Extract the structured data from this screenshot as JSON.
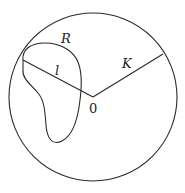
{
  "diagram": {
    "type": "geometric-figure",
    "labels": {
      "region": "R",
      "segment": "l",
      "radius": "K",
      "center": "0"
    },
    "colors": {
      "stroke": "#2a2a2a",
      "background": "#ffffff"
    },
    "geometry": {
      "circle": {
        "cx": 93,
        "cy": 97,
        "r": 84
      },
      "center_point": [
        93,
        97
      ],
      "radius_end": [
        163,
        54
      ],
      "segment_start": [
        23,
        60
      ]
    }
  }
}
